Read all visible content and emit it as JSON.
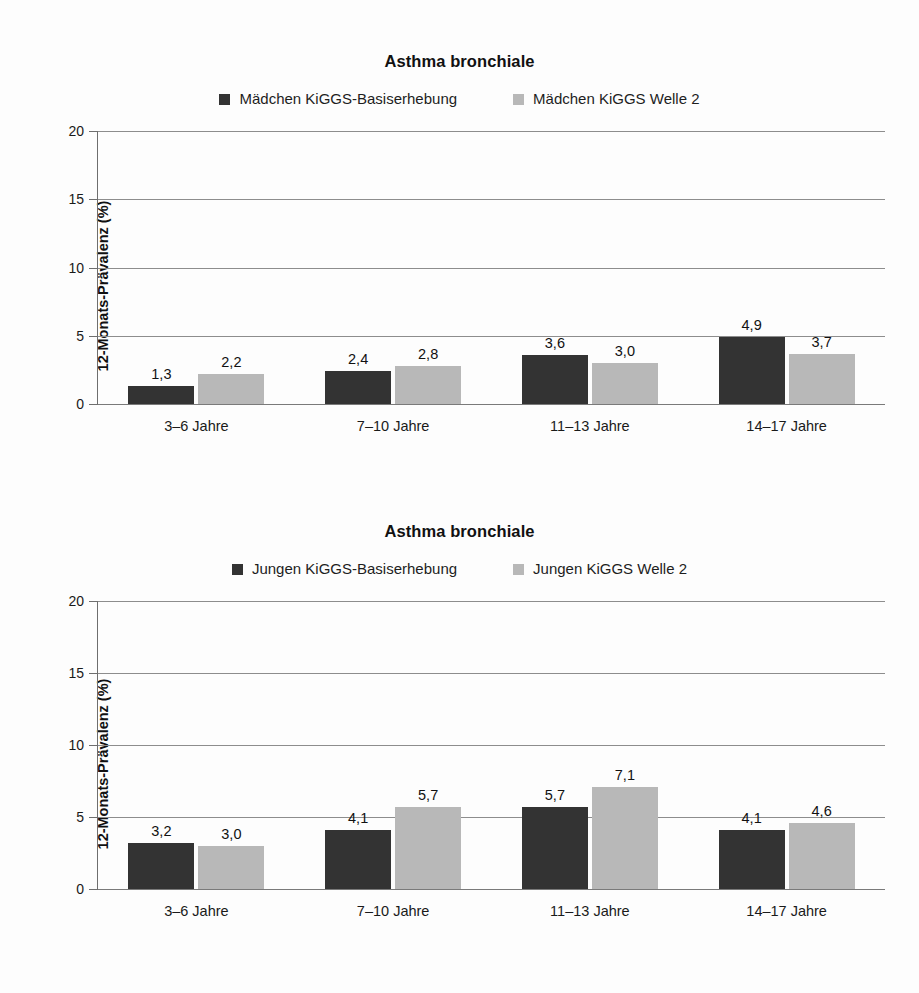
{
  "figure": {
    "background": "#fdfdfd",
    "series_colors": {
      "baseline": "#333333",
      "wave2": "#b8b8b8"
    }
  },
  "charts": [
    {
      "id": "asthma-maedchen",
      "title": "Asthma bronchiale",
      "ylabel": "12-Monats-Prävalenz (%)",
      "legend": [
        {
          "label": "Mädchen KiGGS-Basiserhebung",
          "color": "#333333"
        },
        {
          "label": "Mädchen KiGGS Welle 2",
          "color": "#b8b8b8"
        }
      ],
      "yticks": [
        "0",
        "5",
        "10",
        "15",
        "20"
      ],
      "categories": [
        "3–6 Jahre",
        "7–10 Jahre",
        "11–13 Jahre",
        "14–17 Jahre"
      ],
      "bars": [
        {
          "values": [
            "1,3",
            "2,2"
          ]
        },
        {
          "values": [
            "2,4",
            "2,8"
          ]
        },
        {
          "values": [
            "3,6",
            "3,0"
          ]
        },
        {
          "values": [
            "4,9",
            "3,7"
          ]
        }
      ]
    },
    {
      "id": "asthma-jungen",
      "title": "Asthma bronchiale",
      "ylabel": "12-Monats-Prävalenz (%)",
      "legend": [
        {
          "label": "Jungen KiGGS-Basiserhebung",
          "color": "#333333"
        },
        {
          "label": "Jungen KiGGS Welle 2",
          "color": "#b8b8b8"
        }
      ],
      "yticks": [
        "0",
        "5",
        "10",
        "15",
        "20"
      ],
      "categories": [
        "3–6 Jahre",
        "7–10 Jahre",
        "11–13 Jahre",
        "14–17 Jahre"
      ],
      "bars": [
        {
          "values": [
            "3,2",
            "3,0"
          ]
        },
        {
          "values": [
            "4,1",
            "5,7"
          ]
        },
        {
          "values": [
            "5,7",
            "7,1"
          ]
        },
        {
          "values": [
            "4,1",
            "4,6"
          ]
        }
      ]
    }
  ],
  "chart_data": [
    {
      "type": "bar",
      "title": "Asthma bronchiale",
      "xlabel": "",
      "ylabel": "12-Monats-Prävalenz (%)",
      "ylim": [
        0,
        20
      ],
      "yticks": [
        0,
        5,
        10,
        15,
        20
      ],
      "grid": true,
      "legend_position": "top-center",
      "categories": [
        "3–6 Jahre",
        "7–10 Jahre",
        "11–13 Jahre",
        "14–17 Jahre"
      ],
      "series": [
        {
          "name": "Mädchen KiGGS-Basiserhebung",
          "color": "#333333",
          "values": [
            1.3,
            2.4,
            3.6,
            4.9
          ]
        },
        {
          "name": "Mädchen KiGGS Welle 2",
          "color": "#b8b8b8",
          "values": [
            2.2,
            2.8,
            3.0,
            3.7
          ]
        }
      ],
      "data_labels": [
        [
          "1,3",
          "2,2"
        ],
        [
          "2,4",
          "2,8"
        ],
        [
          "3,6",
          "3,0"
        ],
        [
          "4,9",
          "3,7"
        ]
      ]
    },
    {
      "type": "bar",
      "title": "Asthma bronchiale",
      "xlabel": "",
      "ylabel": "12-Monats-Prävalenz (%)",
      "ylim": [
        0,
        20
      ],
      "yticks": [
        0,
        5,
        10,
        15,
        20
      ],
      "grid": true,
      "legend_position": "top-center",
      "categories": [
        "3–6 Jahre",
        "7–10 Jahre",
        "11–13 Jahre",
        "14–17 Jahre"
      ],
      "series": [
        {
          "name": "Jungen KiGGS-Basiserhebung",
          "color": "#333333",
          "values": [
            3.2,
            4.1,
            5.7,
            4.1
          ]
        },
        {
          "name": "Jungen KiGGS Welle 2",
          "color": "#b8b8b8",
          "values": [
            3.0,
            5.7,
            7.1,
            4.6
          ]
        }
      ],
      "data_labels": [
        [
          "3,2",
          "3,0"
        ],
        [
          "4,1",
          "5,7"
        ],
        [
          "5,7",
          "7,1"
        ],
        [
          "4,1",
          "4,6"
        ]
      ]
    }
  ]
}
